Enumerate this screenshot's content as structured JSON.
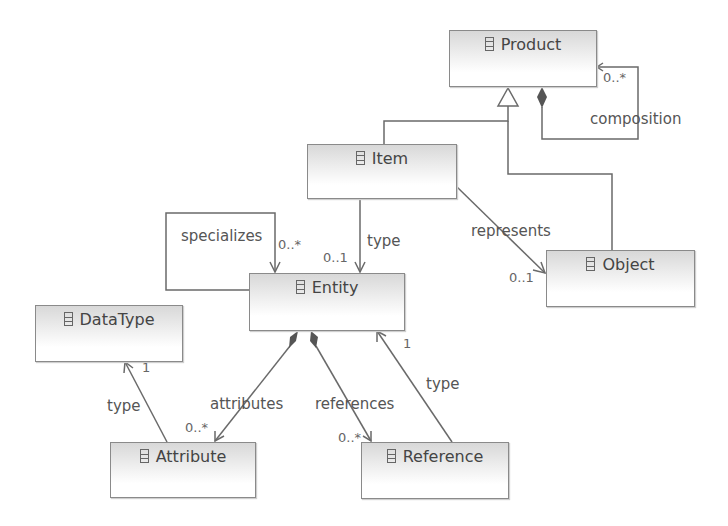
{
  "classes": {
    "product": {
      "name": "Product"
    },
    "item": {
      "name": "Item"
    },
    "object": {
      "name": "Object"
    },
    "entity": {
      "name": "Entity"
    },
    "datatype": {
      "name": "DataType"
    },
    "attribute": {
      "name": "Attribute"
    },
    "reference": {
      "name": "Reference"
    }
  },
  "relations": {
    "composition": {
      "label": "composition",
      "multiplicity": "0..*"
    },
    "represents": {
      "label": "represents",
      "multiplicity": "0..1"
    },
    "item_type": {
      "label": "type",
      "multiplicity": "0..1"
    },
    "specializes": {
      "label": "specializes",
      "multiplicity": "0..*"
    },
    "attributes": {
      "label": "attributes",
      "multiplicity": "0..*"
    },
    "references": {
      "label": "references",
      "multiplicity": "0..*"
    },
    "attr_type": {
      "label": "type",
      "multiplicity": "1"
    },
    "ref_type": {
      "label": "type",
      "multiplicity": "1"
    }
  },
  "colors": {
    "line": "#666666",
    "box_border": "#8a8a8a",
    "text": "#444444"
  }
}
